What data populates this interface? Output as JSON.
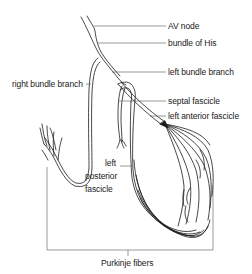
{
  "diagram": {
    "type": "cardiac-conduction-system",
    "labels": {
      "av_node": "AV node",
      "bundle_of_his": "bundle of His",
      "left_bundle_branch": "left bundle branch",
      "right_bundle_branch": "right bundle branch",
      "septal_fascicle": "septal fascicle",
      "left_anterior_fascicle": "left anterior fascicle",
      "left_posterior_fascicle": [
        "left",
        "posterior",
        "fascicle"
      ],
      "purkinje_fibers": "Purkinje fibers"
    },
    "colors": {
      "line": "#1a1a1a",
      "leader": "#555555",
      "background": "#ffffff"
    }
  }
}
